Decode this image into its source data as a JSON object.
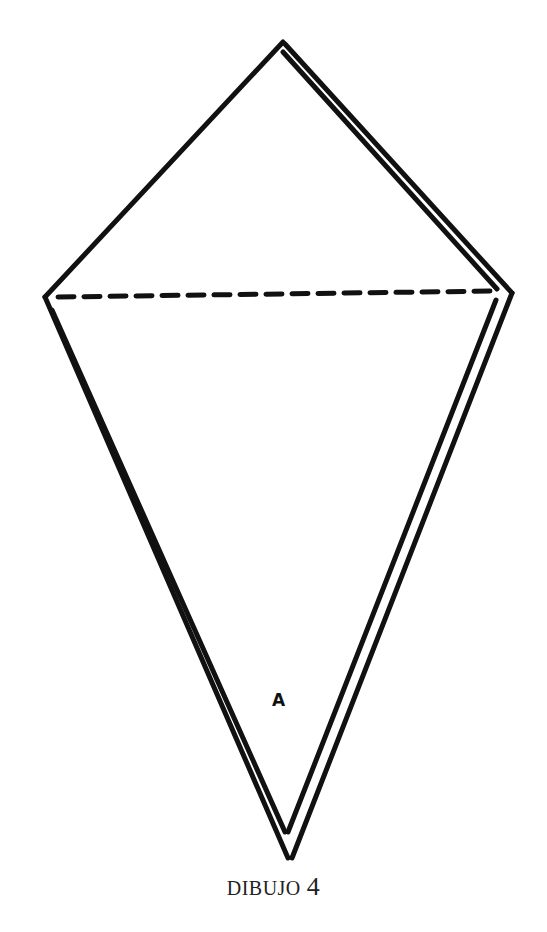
{
  "figure": {
    "caption_word": "DIBUJO",
    "caption_number": "4",
    "point_label": "A",
    "colors": {
      "ink": "#111111",
      "paper": "#ffffff"
    }
  }
}
